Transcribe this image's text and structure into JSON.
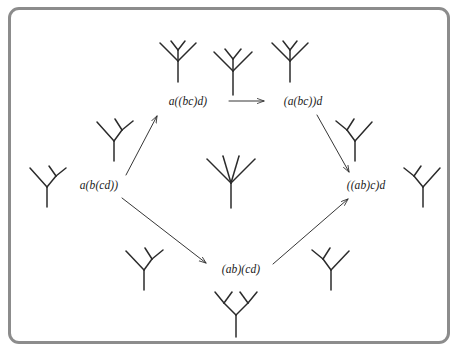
{
  "figure": {
    "domain": "Diagram",
    "border_color": "#8c8c8c",
    "ink_color": "#2b2b2b",
    "background_color": "#ffffff",
    "width": 464,
    "height": 357
  },
  "nodes": [
    {
      "id": "a_bc_d",
      "label": "a((bc)d)",
      "x": 188,
      "y": 101
    },
    {
      "id": "abc_d",
      "label": "(a(bc))d",
      "x": 303,
      "y": 101
    },
    {
      "id": "a_b_cd",
      "label": "a(b(cd))",
      "x": 99,
      "y": 185
    },
    {
      "id": "ab_c_d",
      "label": "((ab)c)d",
      "x": 366,
      "y": 185
    },
    {
      "id": "ab_cd",
      "label": "(ab)(cd)",
      "x": 241,
      "y": 269
    }
  ],
  "edges": [
    {
      "id": "edge-top",
      "from": "a((bc)d)",
      "to": "(a(bc))d",
      "x1": 229,
      "y1": 101,
      "x2": 264,
      "y2": 101
    },
    {
      "id": "edge-upper-left",
      "from": "a(b(cd))",
      "to": "a((bc)d)",
      "x1": 126,
      "y1": 175,
      "x2": 157,
      "y2": 117
    },
    {
      "id": "edge-upper-right",
      "from": "(a(bc))d",
      "to": "((ab)c)d",
      "x1": 317,
      "y1": 115,
      "x2": 349,
      "y2": 172
    },
    {
      "id": "edge-lower-left",
      "from": "a(b(cd))",
      "to": "(ab)(cd)",
      "x1": 123,
      "y1": 198,
      "x2": 205,
      "y2": 263
    },
    {
      "id": "edge-lower-right",
      "from": "(ab)(cd)",
      "to": "((ab)c)d",
      "x1": 273,
      "y1": 264,
      "x2": 347,
      "y2": 200
    }
  ],
  "trees": [
    {
      "id": "tree-a-b-cd-left",
      "shape": "a(b(cd))",
      "near_node": "a(b(cd))",
      "cx": 47,
      "cy": 185,
      "scale": 1.0,
      "rotation": 0,
      "variant": "right-comb"
    },
    {
      "id": "tree-a-b-cd-upper",
      "shape": "a(b(cd))",
      "near_node": "a(b(cd))",
      "cx": 114,
      "cy": 139,
      "scale": 1.0,
      "rotation": 0,
      "variant": "mid-right"
    },
    {
      "id": "tree-a-bc-d-left",
      "shape": "a((bc)d)",
      "near_node": "a((bc)d)",
      "cx": 178,
      "cy": 60,
      "scale": 1.0,
      "rotation": 0,
      "variant": "inner-right"
    },
    {
      "id": "tree-corolla-top",
      "shape": "abcd",
      "near_node": "a((bc)d) - (a(bc))d",
      "cx": 233,
      "cy": 70,
      "scale": 1.0,
      "rotation": 0,
      "variant": "center-y"
    },
    {
      "id": "tree-abc-d-right",
      "shape": "(a(bc))d",
      "near_node": "(a(bc))d",
      "cx": 290,
      "cy": 60,
      "scale": 1.0,
      "rotation": 0,
      "variant": "inner-left"
    },
    {
      "id": "tree-abc-d-lower",
      "shape": "(a(bc))d",
      "near_node": "(a(bc))d",
      "cx": 355,
      "cy": 139,
      "scale": 1.0,
      "rotation": 0,
      "variant": "mid-left"
    },
    {
      "id": "tree-corolla-center",
      "shape": "abcd",
      "near_node": "center",
      "cx": 231,
      "cy": 180,
      "scale": 1.25,
      "rotation": 0,
      "variant": "corolla"
    },
    {
      "id": "tree-ab-c-d-right",
      "shape": "((ab)c)d",
      "near_node": "((ab)c)d",
      "cx": 423,
      "cy": 185,
      "scale": 1.0,
      "rotation": 0,
      "variant": "left-comb"
    },
    {
      "id": "tree-a-b-cd-lower",
      "shape": "a(b(cd))",
      "near_node": "(ab)(cd)",
      "cx": 144,
      "cy": 268,
      "scale": 1.0,
      "rotation": 0,
      "variant": "lower-left"
    },
    {
      "id": "tree-ab-c-d-lower",
      "shape": "((ab)c)d",
      "near_node": "(ab)(cd)",
      "cx": 331,
      "cy": 268,
      "scale": 1.0,
      "rotation": 0,
      "variant": "lower-right"
    },
    {
      "id": "tree-ab-cd-bottom",
      "shape": "(ab)(cd)",
      "near_node": "(ab)(cd)",
      "cx": 236,
      "cy": 313,
      "scale": 1.0,
      "rotation": 0,
      "variant": "balanced"
    }
  ]
}
